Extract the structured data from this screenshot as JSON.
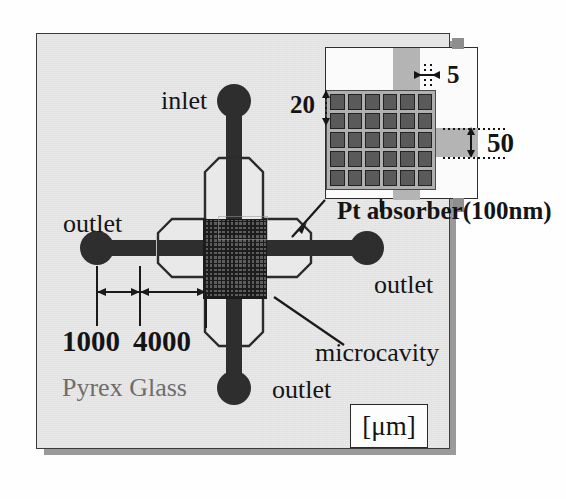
{
  "figure": {
    "type": "technical-schematic",
    "unit_label": "[μm]",
    "substrate_label": "Pyrex Glass"
  },
  "ports": {
    "inlet": "inlet",
    "outlet_left": "outlet",
    "outlet_right": "outlet",
    "outlet_bottom": "outlet"
  },
  "annotations": {
    "microcavity": "microcavity",
    "absorber": "Pt absorber(100nm)"
  },
  "dimensions": {
    "port_offset": "1000",
    "channel_length": "4000",
    "absorber_pitch": "20",
    "absorber_width": "5",
    "cavity_feature": "50"
  },
  "inset": {
    "grid_cols": 6,
    "grid_rows": 5
  },
  "colors": {
    "substrate": "#e9e9e9",
    "channel": "#2e2e2e",
    "cavity": "#5d5d5d",
    "absorber_cell": "#5a5a5a",
    "absorber_field": "#b0b0b0",
    "band": "#b4b4b4",
    "shadow": "#9a9a9a",
    "text": "#141414",
    "text_muted": "#6d6d6d"
  }
}
